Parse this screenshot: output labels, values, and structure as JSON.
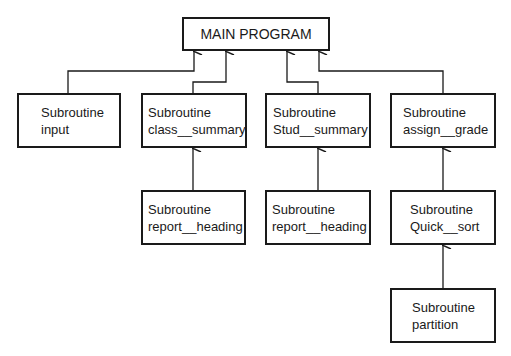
{
  "main": {
    "label": "MAIN PROGRAM"
  },
  "nodes": [
    {
      "id": "input",
      "line1": "Subroutine",
      "line2": "input"
    },
    {
      "id": "class_summary",
      "line1": "Subroutine",
      "line2": "class__summary"
    },
    {
      "id": "stud_summary",
      "line1": "Subroutine",
      "line2": "Stud__summary"
    },
    {
      "id": "assign_grade",
      "line1": "Subroutine",
      "line2": "assign__grade"
    },
    {
      "id": "report_heading_1",
      "line1": "Subroutine",
      "line2": "report__heading"
    },
    {
      "id": "report_heading_2",
      "line1": "Subroutine",
      "line2": "report__heading"
    },
    {
      "id": "quick_sort",
      "line1": "Subroutine",
      "line2": "Quick__sort"
    },
    {
      "id": "partition",
      "line1": "Subroutine",
      "line2": "partition"
    }
  ],
  "edges": [
    {
      "from": "input",
      "to": "MAIN PROGRAM"
    },
    {
      "from": "class_summary",
      "to": "MAIN PROGRAM"
    },
    {
      "from": "stud_summary",
      "to": "MAIN PROGRAM"
    },
    {
      "from": "assign_grade",
      "to": "MAIN PROGRAM"
    },
    {
      "from": "report_heading_1",
      "to": "class_summary"
    },
    {
      "from": "report_heading_2",
      "to": "stud_summary"
    },
    {
      "from": "quick_sort",
      "to": "assign_grade"
    },
    {
      "from": "partition",
      "to": "quick_sort"
    }
  ]
}
